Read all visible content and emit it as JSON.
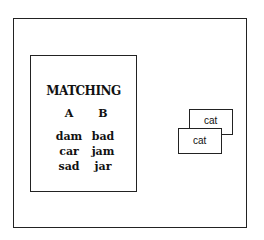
{
  "worksheet": {
    "title": "MATCHING",
    "columns": [
      {
        "header": "A",
        "words": [
          "dam",
          "car",
          "sad"
        ]
      },
      {
        "header": "B",
        "words": [
          "bad",
          "jam",
          "jar"
        ]
      }
    ]
  },
  "cards": [
    {
      "label": "cat"
    },
    {
      "label": "cat"
    }
  ],
  "colors": {
    "line": "#222222",
    "background": "#ffffff"
  }
}
